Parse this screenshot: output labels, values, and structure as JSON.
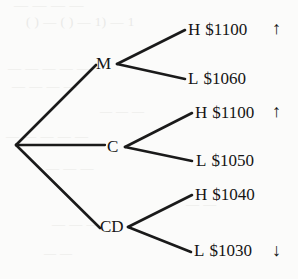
{
  "figure": {
    "type": "decision-tree",
    "orientation": "left-to-right",
    "root": {
      "name": "root-node",
      "label": ""
    },
    "branches": [
      {
        "id": "m",
        "label": "M",
        "leaves": [
          {
            "id": "leaf-1",
            "tag": "H",
            "value": "$1100",
            "marker": "↑",
            "marker_name": "up-arrow"
          },
          {
            "id": "leaf-2",
            "tag": "L",
            "value": "$1060",
            "marker": "",
            "marker_name": ""
          }
        ]
      },
      {
        "id": "c",
        "label": "C",
        "leaves": [
          {
            "id": "leaf-3",
            "tag": "H",
            "value": "$1100",
            "marker": "↑",
            "marker_name": "up-arrow"
          },
          {
            "id": "leaf-4",
            "tag": "L",
            "value": "$1050",
            "marker": "",
            "marker_name": ""
          }
        ]
      },
      {
        "id": "cd",
        "label": "CD",
        "leaves": [
          {
            "id": "leaf-5",
            "tag": "H",
            "value": "$1040",
            "marker": "",
            "marker_name": ""
          },
          {
            "id": "leaf-6",
            "tag": "L",
            "value": "$1030",
            "marker": "↓",
            "marker_name": "down-arrow"
          }
        ]
      }
    ],
    "colors": {
      "background": "#fbfbfa",
      "ink": "#151515",
      "edge": "#1a1a1a",
      "ghost": "#e9e9e7"
    },
    "ghost_text": [
      "— — — —",
      "(  ) — (  ) — 1) — 1",
      "— — — — —",
      "— — — —",
      "— — —",
      "— — — — —",
      "— — —",
      "— —",
      "— — —",
      "— —"
    ]
  }
}
